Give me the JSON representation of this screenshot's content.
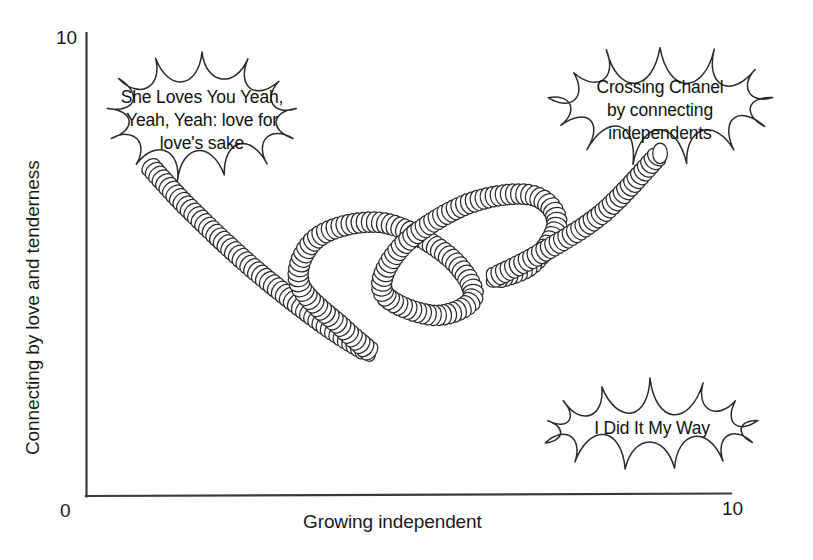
{
  "chart_data": {
    "type": "line",
    "title": "",
    "xlabel": "Growing independent",
    "ylabel": "Connecting by love and tenderness",
    "xlim": [
      0,
      10
    ],
    "ylim": [
      0,
      10
    ],
    "xticks": [
      "0",
      "10"
    ],
    "yticks": [
      "0",
      "10"
    ],
    "grid": false,
    "legend_position": "none",
    "series": [
      {
        "name": "coil path",
        "style": "coiled-spring",
        "description": "A single coiled spring drawn as overlapping circles that starts at upper left, descends to the lower left, loops three times in flattened tilted ovals rising toward the right, and exits at the upper right",
        "x": [
          1.0,
          1.6,
          2.6,
          3.7,
          4.4,
          4.0,
          3.3,
          3.6,
          4.6,
          5.6,
          6.0,
          5.4,
          4.6,
          4.9,
          5.9,
          6.9,
          7.3,
          6.9,
          6.3,
          7.0,
          8.0,
          8.9
        ],
        "y": [
          7.1,
          6.2,
          4.9,
          3.7,
          3.1,
          3.6,
          4.6,
          5.6,
          5.9,
          5.2,
          4.3,
          3.9,
          4.4,
          5.4,
          6.3,
          6.5,
          5.9,
          5.0,
          4.7,
          5.2,
          6.1,
          7.4
        ]
      }
    ],
    "annotations": [
      {
        "id": "annotation-love",
        "shape": "thought-cloud",
        "text": "She Loves You Yeah, Yeah, Yeah: love for love's sake",
        "lines": [
          "She Loves You Yeah,",
          "Yeah, Yeah: love for",
          "love's sake"
        ],
        "x": 2.0,
        "y": 9.0,
        "points_to": "coil-start"
      },
      {
        "id": "annotation-chanel",
        "shape": "thought-cloud",
        "text": "Crossing Chanel by connecting independents",
        "lines": [
          "Crossing Chanel",
          "by connecting",
          "independents"
        ],
        "x": 8.5,
        "y": 9.3,
        "points_to": "coil-end"
      },
      {
        "id": "annotation-my-way",
        "shape": "thought-cloud",
        "text": "I Did It My Way",
        "lines": [
          "I Did It My Way"
        ],
        "x": 8.3,
        "y": 2.0,
        "points_to": "none"
      }
    ],
    "colors": {
      "axis": "#3a3a3a",
      "coil_stroke": "#2b2b2b",
      "cloud_stroke": "#2b2b2b",
      "text": "#111111",
      "background": "#ffffff"
    }
  },
  "axes": {
    "y_title": "Connecting by love and tenderness",
    "x_title": "Growing independent",
    "y_top_tick": "10",
    "x_origin_tick": "0",
    "x_max_tick": "10"
  },
  "clouds": {
    "love": {
      "line1": "She Loves You Yeah,",
      "line2": "Yeah, Yeah: love for",
      "line3": "love's sake"
    },
    "chanel": {
      "line1": "Crossing Chanel",
      "line2": "by connecting",
      "line3": "independents"
    },
    "myway": {
      "line1": "I Did It My Way"
    }
  }
}
